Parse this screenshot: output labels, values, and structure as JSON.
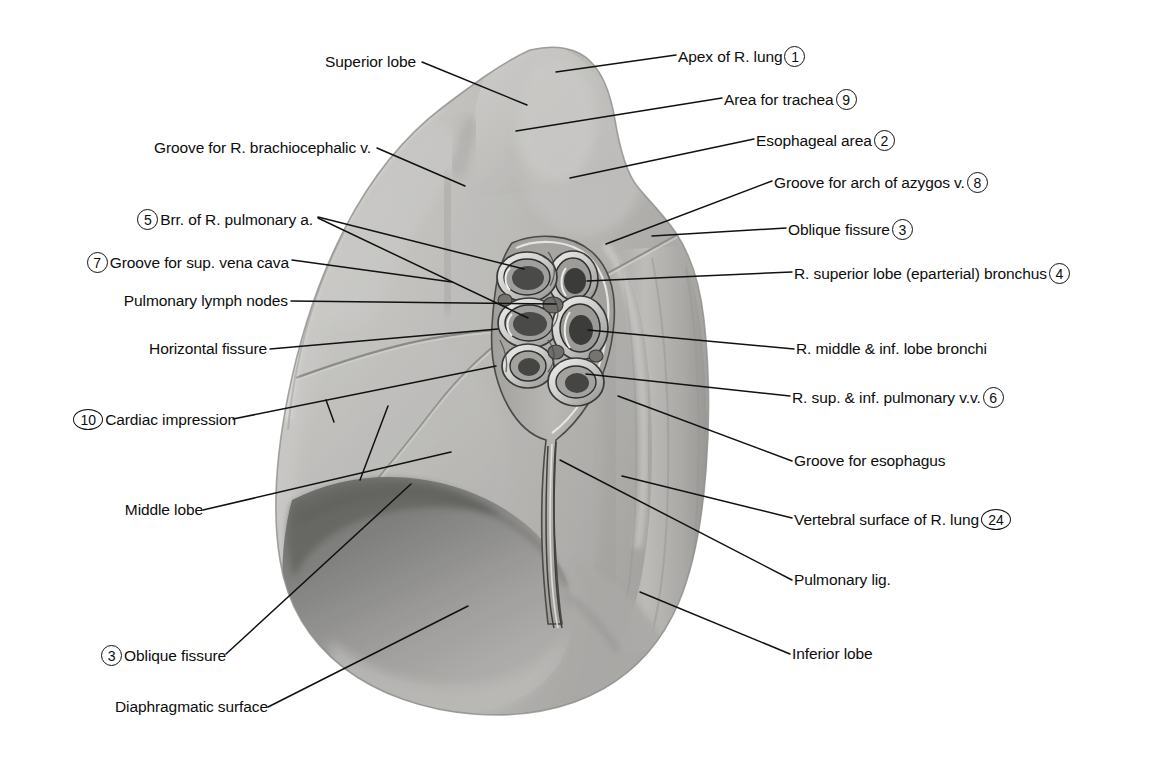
{
  "figure": {
    "colors": {
      "leader_line": "#111111",
      "text": "#0d0d0d",
      "lung_light": "#cdcdcb",
      "lung_mid": "#b9b8b5",
      "lung_dark": "#7e7e7c",
      "background": "#ffffff"
    }
  },
  "labels_right": [
    {
      "id": "apex-of-r-lung",
      "text": "Apex of R. lung",
      "number": "1"
    },
    {
      "id": "area-for-trachea",
      "text": "Area for trachea",
      "number": "9"
    },
    {
      "id": "esophageal-area",
      "text": "Esophageal area",
      "number": "2"
    },
    {
      "id": "groove-for-arch-of-azygos",
      "text": "Groove for arch of azygos v.",
      "number": "8"
    },
    {
      "id": "oblique-fissure-upper",
      "text": "Oblique fissure",
      "number": "3"
    },
    {
      "id": "r-superior-lobe-bronchus",
      "text": "R. superior lobe (eparterial) bronchus",
      "number": "4"
    },
    {
      "id": "r-middle-inf-lobe-bronchi",
      "text": "R. middle & inf. lobe bronchi",
      "number": ""
    },
    {
      "id": "r-sup-inf-pulmonary-vv",
      "text": "R. sup. & inf. pulmonary v.v.",
      "number": "6"
    },
    {
      "id": "groove-for-esophagus",
      "text": "Groove for esophagus",
      "number": ""
    },
    {
      "id": "vertebral-surface",
      "text": "Vertebral surface of R. lung",
      "number": "24"
    },
    {
      "id": "pulmonary-lig",
      "text": "Pulmonary lig.",
      "number": ""
    },
    {
      "id": "inferior-lobe",
      "text": "Inferior lobe",
      "number": ""
    }
  ],
  "labels_left": [
    {
      "id": "superior-lobe",
      "text": "Superior lobe",
      "number": ""
    },
    {
      "id": "groove-r-brachiocephalic-v",
      "text": "Groove for R. brachiocephalic v.",
      "number": ""
    },
    {
      "id": "brr-of-r-pulmonary-a",
      "text": "Brr. of R. pulmonary a.",
      "number": "5"
    },
    {
      "id": "groove-for-sup-vena-cava",
      "text": "Groove for sup. vena cava",
      "number": "7"
    },
    {
      "id": "pulmonary-lymph-nodes",
      "text": "Pulmonary lymph nodes",
      "number": ""
    },
    {
      "id": "horizontal-fissure",
      "text": "Horizontal fissure",
      "number": ""
    },
    {
      "id": "cardiac-impression",
      "text": "Cardiac impression",
      "number": "10"
    },
    {
      "id": "middle-lobe",
      "text": "Middle lobe",
      "number": ""
    },
    {
      "id": "oblique-fissure-lower",
      "text": "Oblique fissure",
      "number": "3"
    },
    {
      "id": "diaphragmatic-surface",
      "text": "Diaphragmatic surface",
      "number": ""
    }
  ]
}
